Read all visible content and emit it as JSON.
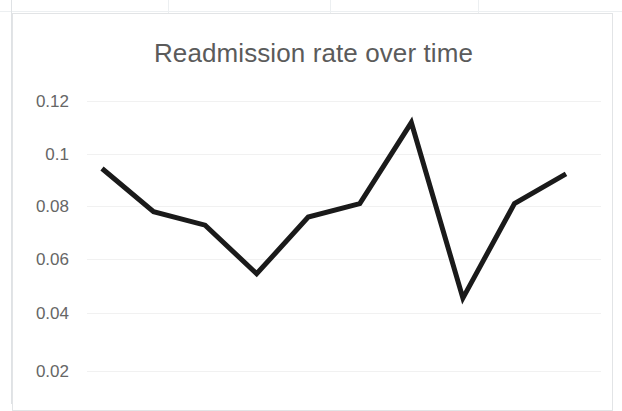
{
  "chart_data": {
    "type": "line",
    "title": "Readmission rate over time",
    "xlabel": "",
    "ylabel": "",
    "grid": true,
    "legend": "none",
    "ylim": [
      0.01,
      0.1255
    ],
    "ytick_labels": [
      "0.12",
      "0.1",
      "0.08",
      "0.06",
      "0.04",
      "0.02"
    ],
    "ytick_values": [
      0.12,
      0.1,
      0.08,
      0.06,
      0.04,
      0.02
    ],
    "x": [
      1,
      2,
      3,
      4,
      5,
      6,
      7,
      8,
      9,
      10
    ],
    "categories": [
      "1",
      "2",
      "3",
      "4",
      "5",
      "6",
      "7",
      "8",
      "9",
      "10"
    ],
    "values": [
      0.095,
      0.079,
      0.074,
      0.056,
      0.077,
      0.082,
      0.112,
      0.047,
      0.082,
      0.093
    ],
    "series": [
      {
        "name": "Readmission rate",
        "values": [
          0.095,
          0.079,
          0.074,
          0.056,
          0.077,
          0.082,
          0.112,
          0.047,
          0.082,
          0.093
        ],
        "color": "#1a1a1a",
        "line_width": 5,
        "markers": "none"
      }
    ]
  },
  "style": {
    "title_color": "#5b5b5b",
    "tick_color": "#666666",
    "gridline_color": "#f1f1f1",
    "line_color": "#1a1a1a",
    "plot_background": "#ffffff",
    "chart_border_color": "#e2e4e6"
  }
}
